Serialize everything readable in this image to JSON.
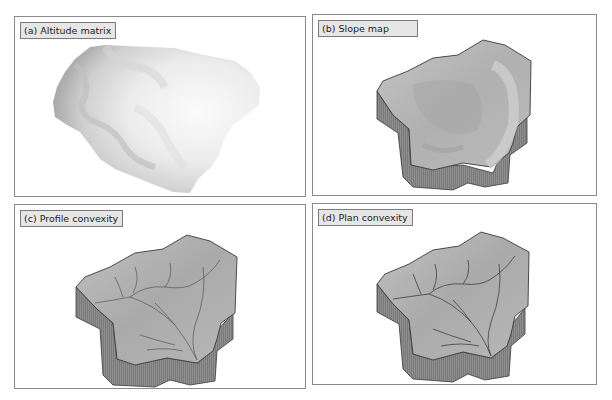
{
  "figure": {
    "panels": [
      {
        "id": "a",
        "label": "(a) Altitude matrix",
        "content": "grayscale altitude raster of catchment"
      },
      {
        "id": "b",
        "label": "(b) Slope map",
        "content": "3D block diagram shaded by slope"
      },
      {
        "id": "c",
        "label": "(c) Profile convexity",
        "content": "3D block diagram shaded by profile convexity with drainage lines"
      },
      {
        "id": "d",
        "label": "(d) Plan convexity",
        "content": "3D block diagram shaded by plan convexity with drainage lines"
      }
    ]
  },
  "colors": {
    "panel_border": "#8a8a8a",
    "label_bg": "#e6e6e6",
    "surface": "#b4b4b4",
    "side_wall": "#8c8c8c",
    "outline": "#3a3a3a"
  }
}
